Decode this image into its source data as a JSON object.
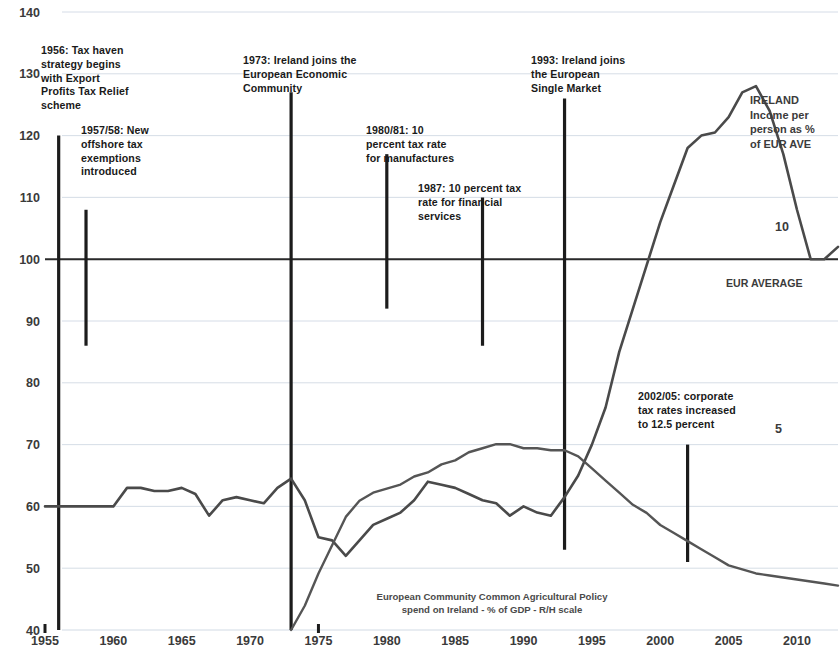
{
  "chart_data": {
    "type": "line",
    "title": "",
    "xlabel": "",
    "ylabel": "",
    "xlim": [
      1955,
      2013
    ],
    "ylim": [
      40,
      140
    ],
    "y_ticks": [
      40,
      50,
      60,
      70,
      80,
      90,
      100,
      110,
      120,
      130,
      140
    ],
    "x_ticks": [
      1955,
      1960,
      1965,
      1970,
      1975,
      1980,
      1985,
      1990,
      1995,
      2000,
      2005,
      2010
    ],
    "grid": true,
    "legend_position": "inline-annotations",
    "secondary_axis": {
      "label": "R/H scale",
      "ticks": [
        5,
        10
      ],
      "ylim": [
        0,
        15.3
      ]
    },
    "reference_line": {
      "label": "EUR AVERAGE",
      "value": 100
    },
    "series": [
      {
        "name": "IRELAND Income per person as % of EUR AVE",
        "axis": "left",
        "x": [
          1955,
          1956,
          1957,
          1958,
          1959,
          1960,
          1961,
          1962,
          1963,
          1964,
          1965,
          1966,
          1967,
          1968,
          1969,
          1970,
          1971,
          1972,
          1973,
          1974,
          1975,
          1976,
          1977,
          1978,
          1979,
          1980,
          1981,
          1982,
          1983,
          1984,
          1985,
          1986,
          1987,
          1988,
          1989,
          1990,
          1991,
          1992,
          1993,
          1994,
          1995,
          1996,
          1997,
          1998,
          1999,
          2000,
          2001,
          2002,
          2003,
          2004,
          2005,
          2006,
          2007,
          2008,
          2009,
          2010,
          2011,
          2012,
          2013
        ],
        "values": [
          60,
          60,
          60,
          60,
          60,
          60,
          63,
          63,
          62.5,
          62.5,
          63,
          62,
          58.5,
          61,
          61.5,
          61,
          60.5,
          63,
          64.5,
          61,
          55,
          54.5,
          52,
          54.5,
          57,
          58,
          59,
          61,
          64,
          63.5,
          63,
          62,
          61,
          60.5,
          58.5,
          60,
          59,
          58.5,
          61.5,
          65,
          70,
          76,
          85,
          92,
          99,
          106,
          112,
          118,
          120,
          120.5,
          123,
          127,
          128,
          124,
          117,
          108,
          100,
          100,
          102
        ]
      },
      {
        "name": "European Community Common Agricultural Policy spend on Ireland - % of GDP - R/H scale",
        "axis": "right",
        "x": [
          1973,
          1974,
          1975,
          1976,
          1977,
          1978,
          1979,
          1980,
          1981,
          1982,
          1983,
          1984,
          1985,
          1986,
          1987,
          1988,
          1989,
          1990,
          1991,
          1992,
          1993,
          1994,
          1995,
          1996,
          1997,
          1998,
          1999,
          2000,
          2001,
          2002,
          2003,
          2004,
          2005,
          2006,
          2007,
          2008,
          2009,
          2010,
          2011,
          2012,
          2013
        ],
        "values": [
          0.0,
          0.6,
          1.4,
          2.1,
          2.8,
          3.2,
          3.4,
          3.5,
          3.6,
          3.8,
          3.9,
          4.1,
          4.2,
          4.4,
          4.5,
          4.6,
          4.6,
          4.5,
          4.5,
          4.45,
          4.45,
          4.3,
          4.0,
          3.7,
          3.4,
          3.1,
          2.9,
          2.6,
          2.4,
          2.2,
          2.0,
          1.8,
          1.6,
          1.5,
          1.4,
          1.35,
          1.3,
          1.25,
          1.2,
          1.15,
          1.1
        ]
      }
    ],
    "annotations": [
      {
        "id": "anno-1956",
        "text": "1956: Tax haven\nstrategy begins\nwith Export\nProfits Tax Relief\nscheme",
        "year": 1956,
        "marker_top": 120,
        "marker_bottom": 40
      },
      {
        "id": "anno-1957",
        "text": "1957/58: New\noffshore tax\nexemptions\nintroduced",
        "year": 1958,
        "marker_top": 108,
        "marker_bottom": 86
      },
      {
        "id": "anno-1973",
        "text": "1973: Ireland joins the\nEuropean Economic\nCommunity",
        "year": 1973,
        "marker_top": 127,
        "marker_bottom": 40
      },
      {
        "id": "anno-1980",
        "text": "1980/81: 10\npercent tax rate\nfor manufactures",
        "year": 1980,
        "marker_top": 117,
        "marker_bottom": 92
      },
      {
        "id": "anno-1987",
        "text": "1987: 10 percent tax\nrate for financial\nservices",
        "year": 1987,
        "marker_top": 110,
        "marker_bottom": 86
      },
      {
        "id": "anno-1993",
        "text": "1993: Ireland joins\nthe European\nSingle Market",
        "year": 1993,
        "marker_top": 126,
        "marker_bottom": 53
      },
      {
        "id": "anno-2002",
        "text": "2002/05: corporate\ntax rates increased\nto 12.5 percent",
        "year": 2002,
        "marker_top": 70,
        "marker_bottom": 51
      }
    ],
    "series_labels": {
      "ireland": "IRELAND\nIncome per\nperson as %\nof EUR AVE",
      "eur_average": "EUR AVERAGE",
      "cap": "European Community Common Agricultural Policy\nspend on Ireland - % of GDP - R/H scale"
    }
  },
  "colors": {
    "ireland_line": "#4a4a4a",
    "cap_line": "#555555",
    "grid": "#c9d4e0",
    "reference_line": "#2a2a2a",
    "marker": "#1c1c1c",
    "tick_text": "#3a3a3a"
  }
}
